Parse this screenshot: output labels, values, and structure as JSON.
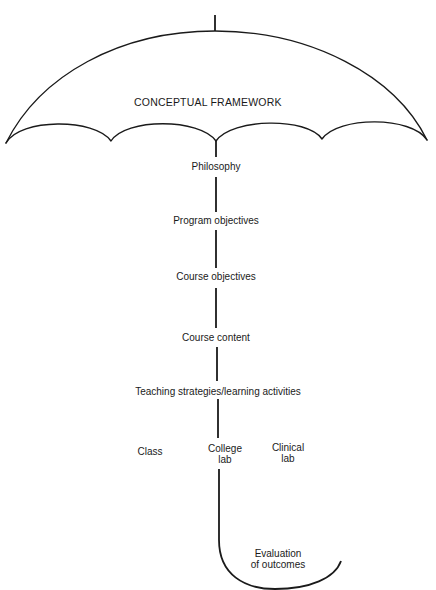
{
  "diagram": {
    "title": "CONCEPTUAL FRAMEWORK",
    "stem_nodes": [
      "Philosophy",
      "Program objectives",
      "Course objectives",
      "Course content",
      "Teaching strategies/learning activities"
    ],
    "branches": {
      "class": "Class",
      "college_lab_line1": "College",
      "college_lab_line2": "lab",
      "clinical_lab_line1": "Clinical",
      "clinical_lab_line2": "lab"
    },
    "handle": {
      "line1": "Evaluation",
      "line2": "of outcomes"
    },
    "colors": {
      "ink": "#1a1a1a",
      "background": "#ffffff"
    }
  }
}
